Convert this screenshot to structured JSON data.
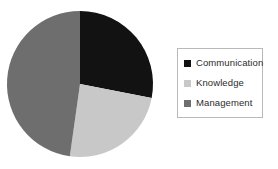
{
  "chart_data": {
    "type": "pie",
    "title": "",
    "categories": [
      "Communication",
      "Knowledge",
      "Management"
    ],
    "values": [
      28,
      24,
      48
    ],
    "value_unit": "percent",
    "colors": [
      "#121212",
      "#c8c8c8",
      "#6e6e6e"
    ],
    "start_angle_deg": 0,
    "direction": "clockwise",
    "legend": {
      "position": "right",
      "border": true,
      "entries": [
        {
          "label": "Communication",
          "color": "#121212",
          "value": 28
        },
        {
          "label": "Knowledge",
          "color": "#c8c8c8",
          "value": 24
        },
        {
          "label": "Management",
          "color": "#6e6e6e",
          "value": 48
        }
      ]
    },
    "slices": [
      {
        "label": "Communication",
        "value": 28,
        "color": "#121212",
        "start_deg": 0,
        "end_deg": 101
      },
      {
        "label": "Knowledge",
        "value": 24,
        "color": "#c8c8c8",
        "start_deg": 101,
        "end_deg": 188
      },
      {
        "label": "Management",
        "value": 48,
        "color": "#6e6e6e",
        "start_deg": 188,
        "end_deg": 360
      }
    ],
    "grid": false,
    "xlabel": "",
    "ylabel": ""
  },
  "colors": {
    "background": "#ffffff",
    "legend_border": "#b9b9b9",
    "legend_text": "#2b2b2b"
  }
}
